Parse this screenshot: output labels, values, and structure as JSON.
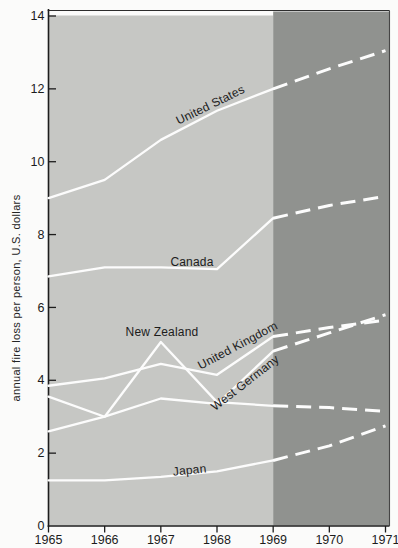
{
  "chart_data": {
    "type": "line",
    "title": "",
    "xlabel": "",
    "ylabel": "annual fire loss per person, U.S. dollars",
    "x_ticks": [
      "1965",
      "1966",
      "1967",
      "1968",
      "1969",
      "1970",
      "1971"
    ],
    "y_ticks": [
      "0",
      "2",
      "4",
      "6",
      "8",
      "10",
      "12",
      "14"
    ],
    "xlim": [
      1965,
      1971
    ],
    "ylim": [
      0,
      14
    ],
    "grid": false,
    "legend_position": "labels-on-lines",
    "line_color": "#fcfcfc",
    "text_color": "#1c1c1c",
    "regions": [
      {
        "name": "historical",
        "from": 1965,
        "to": 1969,
        "color": "#c6c7c4",
        "line_style": "solid"
      },
      {
        "name": "projected",
        "from": 1969,
        "to": 1971,
        "color": "#90928f",
        "line_style": "dashed"
      }
    ],
    "series": [
      {
        "name": "United States",
        "years_solid": [
          1965,
          1966,
          1967,
          1968,
          1969
        ],
        "values_solid": [
          9.0,
          9.5,
          10.6,
          11.4,
          12.0
        ],
        "years_dashed": [
          1969,
          1970,
          1971
        ],
        "values_dashed": [
          12.0,
          12.55,
          13.05
        ],
        "label": {
          "x": 212,
          "y": 108.5,
          "angle": -26
        }
      },
      {
        "name": "Canada",
        "years_solid": [
          1965,
          1966,
          1967,
          1968,
          1969
        ],
        "values_solid": [
          6.85,
          7.1,
          7.1,
          7.05,
          8.45
        ],
        "years_dashed": [
          1969,
          1970,
          1971
        ],
        "values_dashed": [
          8.45,
          8.8,
          9.05
        ],
        "label": {
          "x": 192,
          "y": 266,
          "angle": 0
        }
      },
      {
        "name": "New Zealand",
        "years_solid": [
          1965,
          1966,
          1967,
          1968,
          1969
        ],
        "values_solid": [
          3.55,
          3.0,
          5.05,
          3.4,
          3.3
        ],
        "years_dashed": [
          1969,
          1970,
          1971
        ],
        "values_dashed": [
          3.3,
          3.25,
          3.15
        ],
        "label": {
          "x": 162,
          "y": 336,
          "angle": 0
        }
      },
      {
        "name": "United Kingdom",
        "years_solid": [
          1965,
          1966,
          1967,
          1968,
          1969
        ],
        "values_solid": [
          3.85,
          4.05,
          4.45,
          4.15,
          5.2
        ],
        "years_dashed": [
          1969,
          1970,
          1971
        ],
        "values_dashed": [
          5.2,
          5.45,
          5.65
        ],
        "label": {
          "x": 239.5,
          "y": 349,
          "angle": -28
        }
      },
      {
        "name": "West Germany",
        "years_solid": [
          1965,
          1966,
          1967,
          1968,
          1969
        ],
        "values_solid": [
          2.6,
          3.0,
          3.5,
          3.35,
          4.8
        ],
        "years_dashed": [
          1969,
          1970,
          1971
        ],
        "values_dashed": [
          4.8,
          5.3,
          5.8
        ],
        "label": {
          "x": 247.5,
          "y": 386,
          "angle": -38
        }
      },
      {
        "name": "Japan",
        "years_solid": [
          1965,
          1966,
          1967,
          1968,
          1969
        ],
        "values_solid": [
          1.25,
          1.25,
          1.35,
          1.5,
          1.8
        ],
        "years_dashed": [
          1969,
          1970,
          1971
        ],
        "values_dashed": [
          1.8,
          2.2,
          2.75
        ],
        "label": {
          "x": 190,
          "y": 474,
          "angle": -6
        }
      }
    ]
  }
}
